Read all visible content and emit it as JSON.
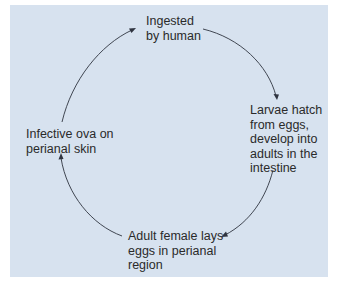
{
  "diagram": {
    "type": "cycle",
    "background_color": "#d7e2ef",
    "text_color": "#2a2a2a",
    "arrow_color": "#2f3440",
    "nodes": [
      {
        "id": "ingested",
        "label": "Ingested\nby human"
      },
      {
        "id": "larvae",
        "label": "Larvae hatch\nfrom eggs,\ndevelop into\nadults in the\nintestine"
      },
      {
        "id": "adult",
        "label": "Adult female lays\neggs in perianal\nregion"
      },
      {
        "id": "ova",
        "label": "Infective ova on\nperianal skin"
      }
    ],
    "edges": [
      {
        "from": "ingested",
        "to": "larvae",
        "direction": "clockwise"
      },
      {
        "from": "larvae",
        "to": "adult",
        "direction": "clockwise"
      },
      {
        "from": "adult",
        "to": "ova",
        "direction": "clockwise"
      },
      {
        "from": "ova",
        "to": "ingested",
        "direction": "clockwise"
      }
    ]
  }
}
